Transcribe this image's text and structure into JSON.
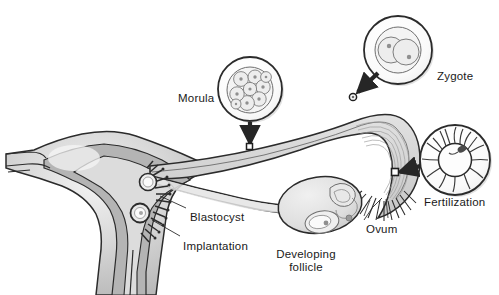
{
  "palette": {
    "outline": "#2b2b2b",
    "organ_fill_light": "#e6e6e6",
    "organ_fill_mid": "#c9c9c9",
    "organ_fill_dark": "#a8a8a8",
    "tube_fill": "#d5d5d5",
    "inset_fill": "#fbfbfb",
    "cell_fill": "#ececec",
    "nucleus": "#8f8f8f",
    "arrow": "#262626",
    "text": "#1a1a1a",
    "background": "#ffffff",
    "shadow": "#bdbdbd"
  },
  "labels": [
    {
      "id": "morula",
      "text": "Morula",
      "x": 178,
      "y": 92,
      "align": "left"
    },
    {
      "id": "zygote",
      "text": "Zygote",
      "x": 437,
      "y": 70,
      "align": "left"
    },
    {
      "id": "fertilization",
      "text": "Fertilization",
      "x": 432,
      "y": 196,
      "align": "left"
    },
    {
      "id": "blastocyst",
      "text": "Blastocyst",
      "x": 190,
      "y": 211,
      "align": "left"
    },
    {
      "id": "implantation",
      "text": "Implantation",
      "x": 183,
      "y": 240,
      "align": "left"
    },
    {
      "id": "ovum",
      "text": "Ovum",
      "x": 366,
      "y": 223,
      "align": "left"
    },
    {
      "id": "developing-follicle",
      "text": "Developing\nfollicle",
      "x": 305,
      "y": 248,
      "align": "center"
    }
  ],
  "insets": [
    {
      "id": "morula-inset",
      "label": "Morula",
      "cx": 250,
      "cy": 89,
      "r": 32,
      "cells": 9,
      "detail": "multicellular ball of blastomeres"
    },
    {
      "id": "zygote-inset",
      "label": "Zygote",
      "cx": 398,
      "cy": 50,
      "r": 34,
      "detail": "two overlapping pronuclei"
    },
    {
      "id": "fertilization-inset",
      "label": "Fertilization",
      "cx": 455,
      "cy": 160,
      "r": 35,
      "detail": "ovum surrounded by radiating sperm"
    }
  ],
  "structures": [
    {
      "id": "uterus",
      "name": "uterus"
    },
    {
      "id": "uterine-cavity",
      "name": "uterine cavity"
    },
    {
      "id": "cervix",
      "name": "cervical canal"
    },
    {
      "id": "fallopian-tube",
      "name": "fallopian tube"
    },
    {
      "id": "fimbriae",
      "name": "fimbriae"
    },
    {
      "id": "ovary",
      "name": "ovary"
    },
    {
      "id": "corpus-luteum",
      "name": "corpus luteum"
    },
    {
      "id": "graafian-follicle",
      "name": "graafian follicle"
    },
    {
      "id": "ovarian-ligament",
      "name": "ovarian ligament"
    },
    {
      "id": "broad-ligament",
      "name": "broad ligament"
    },
    {
      "id": "blastocyst-stage",
      "name": "blastocyst at uterine wall"
    },
    {
      "id": "implanting-stage",
      "name": "implanting embryo"
    }
  ],
  "arrows": [
    {
      "id": "morula-arrow",
      "from": "morula-inset",
      "to": "fallopian-tube",
      "direction": "down"
    },
    {
      "id": "zygote-arrow",
      "from": "zygote-inset",
      "to": "fallopian-tube",
      "direction": "down-left"
    },
    {
      "id": "fertilization-arrow",
      "from": "fertilization-inset",
      "to": "fallopian-tube",
      "direction": "left"
    }
  ],
  "leaders": [
    {
      "id": "blastocyst-leader",
      "label": "Blastocyst"
    },
    {
      "id": "implantation-leader",
      "label": "Implantation"
    },
    {
      "id": "ovum-leader",
      "label": "Ovum"
    }
  ]
}
